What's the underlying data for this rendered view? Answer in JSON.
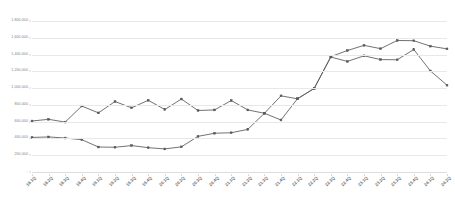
{
  "chart_data": {
    "type": "line",
    "title": "",
    "subtitle": "",
    "xlabel": "",
    "ylabel": "",
    "grid": true,
    "legend": "none",
    "ylim": [
      0,
      1800000
    ],
    "y_ticks": [
      0,
      200000,
      400000,
      600000,
      800000,
      1000000,
      1200000,
      1400000,
      1600000,
      1800000
    ],
    "y_tick_labels": [
      "-",
      "200,000",
      "400,000",
      "600,000",
      "800,000",
      "1,000,000",
      "1,200,000",
      "1,400,000",
      "1,600,000",
      "1,800,000"
    ],
    "categories": [
      "18.1Q",
      "18.2Q",
      "18.3Q",
      "18.4Q",
      "19.1Q",
      "19.2Q",
      "19.3Q",
      "19.4Q",
      "20.1Q",
      "20.2Q",
      "20.3Q",
      "20.4Q",
      "21.1Q",
      "21.2Q",
      "21.3Q",
      "21.4Q",
      "22.1Q",
      "22.2Q",
      "22.3Q",
      "22.4Q",
      "23.1Q",
      "23.2Q",
      "23.3Q",
      "23.4Q",
      "24.1Q",
      "24.2Q"
    ],
    "series": [
      {
        "name": "series-a",
        "color": "#595959",
        "values": [
          608000,
          628000,
          595000,
          786000,
          705000,
          840000,
          765000,
          855000,
          745000,
          870000,
          733000,
          740000,
          852000,
          740000,
          700000,
          620000,
          875000,
          995000,
          1370000,
          1318000,
          1385000,
          1340000,
          1338000,
          1460000,
          1205000,
          1035000
        ]
      },
      {
        "name": "series-b",
        "color": "#595959",
        "values": [
          412000,
          418000,
          405000,
          385000,
          298000,
          295000,
          315000,
          290000,
          275000,
          300000,
          425000,
          462000,
          468000,
          508000,
          700000,
          908000,
          872000,
          998000,
          1375000,
          1448000,
          1510000,
          1470000,
          1568000,
          1565000,
          1500000,
          1468000
        ]
      }
    ]
  }
}
